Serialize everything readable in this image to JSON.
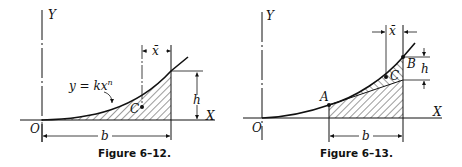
{
  "figures": [
    {
      "caption": "Figure 6–12.",
      "axes": {
        "y_label": "Y",
        "x_label": "X",
        "origin_label": "O"
      },
      "curve_label": "y = kx",
      "curve_exponent": "n",
      "centroid_label": "C",
      "xbar_label": "x̄",
      "height_label": "h",
      "base_label": "b"
    },
    {
      "caption": "Figure 6–13.",
      "axes": {
        "y_label": "Y",
        "x_label": "X",
        "origin_label": "O"
      },
      "point_a_label": "A",
      "point_b_label": "B",
      "centroid_label": "C",
      "xbar_label": "x̄",
      "height_label": "h",
      "base_label": "b"
    }
  ]
}
